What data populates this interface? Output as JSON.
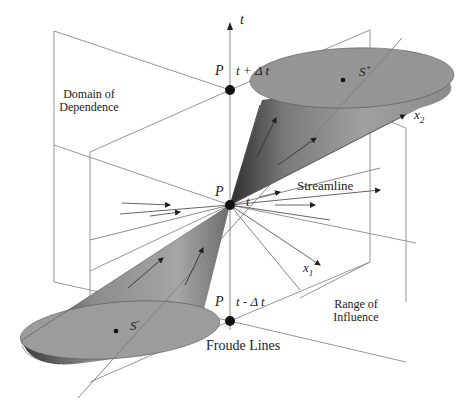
{
  "diagram": {
    "labels": {
      "t_axis": "t",
      "P_top": "P",
      "t_plus": "t + Δ t",
      "P_mid": "P",
      "t_mid": "t",
      "P_bottom": "P",
      "t_minus": "t - Δ t",
      "domain_line1": "Domain of",
      "domain_line2": "Dependence",
      "range_line1": "Range of",
      "range_line2": "Influence",
      "streamline": "Streamline",
      "froude": "Froude Lines",
      "x1": "x",
      "x1_sub": "1",
      "x2": "x",
      "x2_sub": "2",
      "S_plus": "S",
      "S_plus_sup": "+",
      "S_minus": "S",
      "S_minus_sup": "-"
    },
    "colors": {
      "cone_fill": "#8f8f8f",
      "cone_dark": "#3a3a3a",
      "ellipse_fill": "#9a9a9a",
      "frame": "#8a8a8a",
      "point": "#111111"
    }
  }
}
